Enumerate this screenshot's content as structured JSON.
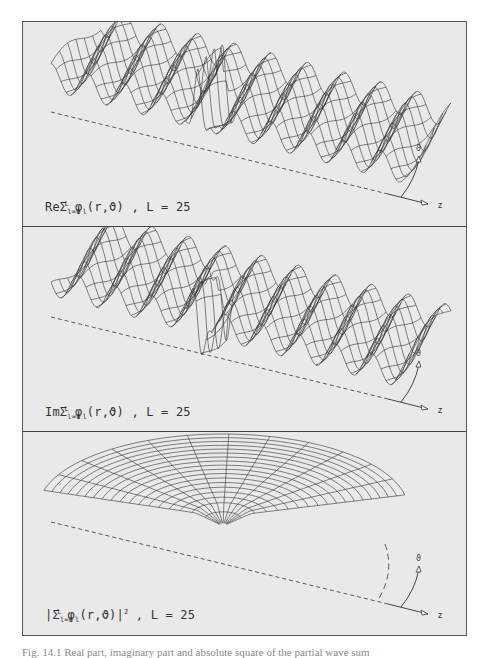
{
  "figure": {
    "caption_fragment": "Fig. 14.1 Real part, imaginary part and absolute square of the partial wave sum",
    "background_color": "#e9e9e9",
    "line_color": "#333333",
    "panels": [
      {
        "id": "real",
        "label_prefix": "Re",
        "label_sum": "Σ",
        "label_sub": "l=0",
        "label_sup": "L",
        "label_func": "φ",
        "label_func_sub": "l",
        "label_args": "(r,ϑ)",
        "label_suffix": ")",
        "label_param": " ,  L  =  25",
        "display_text": "ReΣ_{l=0}^{L} φ_l(r,ϑ) , L = 25",
        "L": 25,
        "plot_type": "3d-wireframe-oscillating",
        "axis_theta": "ϑ",
        "axis_z": "z"
      },
      {
        "id": "imaginary",
        "label_prefix": "Im",
        "label_sum": "Σ",
        "label_sub": "l=0",
        "label_sup": "L",
        "label_func": "φ",
        "label_func_sub": "l",
        "label_args": "(r,ϑ)",
        "label_param": " ,  L  =  25",
        "display_text": "ImΣ_{l=0}^{L} φ_l(r,ϑ) , L = 25",
        "L": 25,
        "plot_type": "3d-wireframe-oscillating",
        "axis_theta": "ϑ",
        "axis_z": "z"
      },
      {
        "id": "absolute-square",
        "label_prefix": "|",
        "label_sum": "Σ",
        "label_sub": "l=0",
        "label_sup": "L",
        "label_func": "φ",
        "label_func_sub": "l",
        "label_args": "(r,ϑ)|",
        "label_power": "2",
        "label_param": " ,  L  =  25",
        "display_text": "|Σ_{l=0}^{L} φ_l(r,ϑ)|² , L = 25",
        "L": 25,
        "plot_type": "3d-wireframe-polar-surface",
        "axis_theta": "ϑ",
        "axis_z": "z"
      }
    ]
  }
}
